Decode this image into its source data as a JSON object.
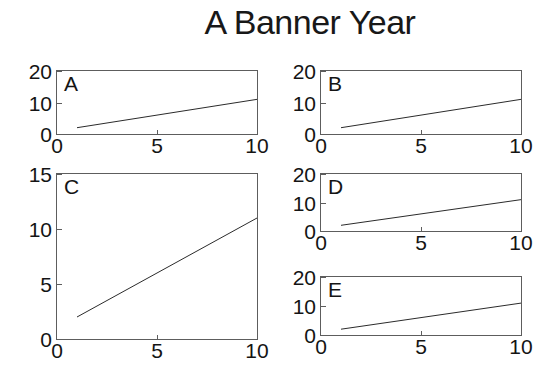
{
  "figure": {
    "title": "A Banner Year",
    "background": "#ffffff",
    "line_color": "#2b2b2b",
    "axis_color": "#5d5d5d",
    "width": 556,
    "height": 387
  },
  "chart_data": [
    {
      "type": "line",
      "panel": "A",
      "title": "A Banner Year",
      "xlabel": "",
      "ylabel": "",
      "xlim": [
        0,
        10
      ],
      "ylim": [
        0,
        20
      ],
      "xticks": [
        0,
        5,
        10
      ],
      "xticklabels": [
        "0",
        "5",
        "10"
      ],
      "yticks": [
        0,
        10,
        20
      ],
      "yticklabels": [
        "0",
        "10",
        "20"
      ],
      "grid": false,
      "legend": false,
      "series": [
        {
          "name": "trend",
          "x": [
            1,
            2,
            3,
            4,
            5,
            6,
            7,
            8,
            9,
            10
          ],
          "y": [
            2,
            3,
            4,
            5,
            6,
            7,
            8,
            9,
            10,
            11
          ]
        }
      ]
    },
    {
      "type": "line",
      "panel": "B",
      "xlabel": "",
      "ylabel": "",
      "xlim": [
        0,
        10
      ],
      "ylim": [
        0,
        20
      ],
      "xticks": [
        0,
        5,
        10
      ],
      "xticklabels": [
        "0",
        "5",
        "10"
      ],
      "yticks": [
        0,
        10,
        20
      ],
      "yticklabels": [
        "0",
        "10",
        "20"
      ],
      "grid": false,
      "legend": false,
      "series": [
        {
          "name": "trend",
          "x": [
            1,
            2,
            3,
            4,
            5,
            6,
            7,
            8,
            9,
            10
          ],
          "y": [
            2,
            3,
            4,
            5,
            6,
            7,
            8,
            9,
            10,
            11
          ]
        }
      ]
    },
    {
      "type": "line",
      "panel": "C",
      "xlabel": "",
      "ylabel": "",
      "xlim": [
        0,
        10
      ],
      "ylim": [
        0,
        15
      ],
      "xticks": [
        0,
        5,
        10
      ],
      "xticklabels": [
        "0",
        "5",
        "10"
      ],
      "yticks": [
        0,
        5,
        10,
        15
      ],
      "yticklabels": [
        "0",
        "5",
        "10",
        "15"
      ],
      "grid": false,
      "legend": false,
      "series": [
        {
          "name": "trend",
          "x": [
            1,
            2,
            3,
            4,
            5,
            6,
            7,
            8,
            9,
            10
          ],
          "y": [
            2,
            3,
            4,
            5,
            6,
            7,
            8,
            9,
            10,
            11
          ]
        }
      ]
    },
    {
      "type": "line",
      "panel": "D",
      "xlabel": "",
      "ylabel": "",
      "xlim": [
        0,
        10
      ],
      "ylim": [
        0,
        20
      ],
      "xticks": [
        0,
        5,
        10
      ],
      "xticklabels": [
        "0",
        "5",
        "10"
      ],
      "yticks": [
        0,
        10,
        20
      ],
      "yticklabels": [
        "0",
        "10",
        "20"
      ],
      "grid": false,
      "legend": false,
      "series": [
        {
          "name": "trend",
          "x": [
            1,
            2,
            3,
            4,
            5,
            6,
            7,
            8,
            9,
            10
          ],
          "y": [
            2,
            3,
            4,
            5,
            6,
            7,
            8,
            9,
            10,
            11
          ]
        }
      ]
    },
    {
      "type": "line",
      "panel": "E",
      "xlabel": "",
      "ylabel": "",
      "xlim": [
        0,
        10
      ],
      "ylim": [
        0,
        20
      ],
      "xticks": [
        0,
        5,
        10
      ],
      "xticklabels": [
        "0",
        "5",
        "10"
      ],
      "yticks": [
        0,
        10,
        20
      ],
      "yticklabels": [
        "0",
        "10",
        "20"
      ],
      "grid": false,
      "legend": false,
      "series": [
        {
          "name": "trend",
          "x": [
            1,
            2,
            3,
            4,
            5,
            6,
            7,
            8,
            9,
            10
          ],
          "y": [
            2,
            3,
            4,
            5,
            6,
            7,
            8,
            9,
            10,
            11
          ]
        }
      ]
    }
  ],
  "panels": {
    "A": {
      "letter": "A",
      "rect": [
        56,
        70,
        202,
        65
      ]
    },
    "B": {
      "letter": "B",
      "rect": [
        320,
        70,
        202,
        65
      ]
    },
    "C": {
      "letter": "C",
      "rect": [
        56,
        173,
        202,
        167
      ]
    },
    "D": {
      "letter": "D",
      "rect": [
        320,
        173,
        202,
        59
      ]
    },
    "E": {
      "letter": "E",
      "rect": [
        320,
        276,
        202,
        60
      ]
    }
  }
}
